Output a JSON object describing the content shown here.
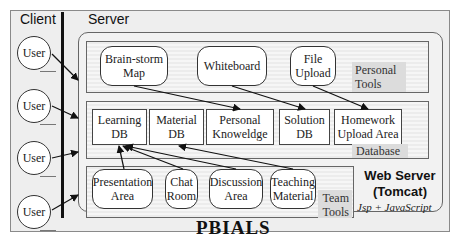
{
  "diagram": {
    "client_label": "Client",
    "server_label": "Server",
    "users": [
      "User",
      "User",
      "User",
      "User"
    ],
    "personal_tools": {
      "label": "Personal\nTools",
      "items": [
        "Brain-storm\nMap",
        "Whiteboard",
        "File\nUpload"
      ]
    },
    "database": {
      "label": "Database",
      "items": [
        "Learning\nDB",
        "Material\nDB",
        "Personal\nKnoweldge",
        "Solution\nDB",
        "Homework\nUpload Area"
      ]
    },
    "team_tools": {
      "label": "Team\nTools",
      "items": [
        "Presentation\nArea",
        "Chat\nRoom",
        "Discussion\nArea",
        "Teaching\nMaterial"
      ]
    },
    "web_server": {
      "title": "Web Server\n(Tomcat)",
      "subtitle": "Jsp + JavaScript"
    },
    "system_name": "PBIALS"
  }
}
